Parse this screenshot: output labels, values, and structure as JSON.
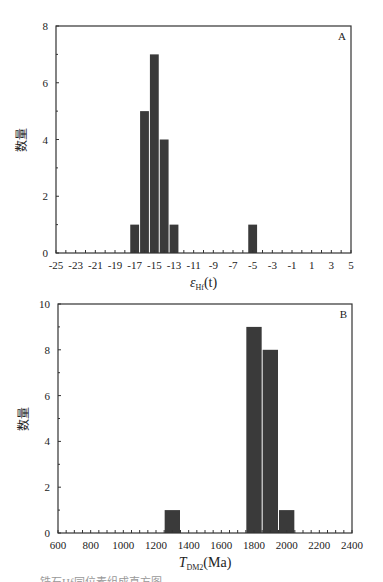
{
  "chart_data": [
    {
      "type": "bar",
      "panel_label": "A",
      "title": "",
      "xlabel": "εHf(t)",
      "xlabel_main": "ε",
      "xlabel_sub": "Hf",
      "xlabel_tail": "(t)",
      "ylabel": "数量",
      "xlim": [
        -25,
        5
      ],
      "ylim": [
        0,
        8
      ],
      "x_ticks": [
        "-25",
        "-23",
        "-21",
        "-19",
        "-17",
        "-15",
        "-13",
        "-11",
        "-9",
        "-7",
        "-5",
        "-3",
        "-1",
        "1",
        "3",
        "5"
      ],
      "y_ticks": [
        "0",
        "2",
        "4",
        "6",
        "8"
      ],
      "bin_width": 1,
      "bins": [
        {
          "start": -17.5,
          "end": -16.5,
          "count": 1
        },
        {
          "start": -16.5,
          "end": -15.5,
          "count": 5
        },
        {
          "start": -15.5,
          "end": -14.5,
          "count": 7
        },
        {
          "start": -14.5,
          "end": -13.5,
          "count": 4
        },
        {
          "start": -13.5,
          "end": -12.5,
          "count": 1
        },
        {
          "start": -5.5,
          "end": -4.5,
          "count": 1
        }
      ],
      "grid": false,
      "bar_color": "#3a3a3a"
    },
    {
      "type": "bar",
      "panel_label": "B",
      "title": "",
      "xlabel": "TDM2(Ma)",
      "xlabel_main": "T",
      "xlabel_sub": "DM2",
      "xlabel_tail": "(Ma)",
      "ylabel": "数量",
      "xlim": [
        600,
        2400
      ],
      "ylim": [
        0,
        10
      ],
      "x_ticks": [
        "600",
        "800",
        "1000",
        "1200",
        "1400",
        "1600",
        "1800",
        "2000",
        "2200",
        "2400"
      ],
      "y_ticks": [
        "0",
        "2",
        "4",
        "6",
        "8",
        "10"
      ],
      "bin_width": 100,
      "bins": [
        {
          "start": 1250,
          "end": 1350,
          "count": 1
        },
        {
          "start": 1750,
          "end": 1850,
          "count": 9
        },
        {
          "start": 1850,
          "end": 1950,
          "count": 8
        },
        {
          "start": 1950,
          "end": 2050,
          "count": 1
        }
      ],
      "grid": false,
      "bar_color": "#3a3a3a"
    }
  ],
  "caption_partial": "锆石Hf同位素组成直方图"
}
